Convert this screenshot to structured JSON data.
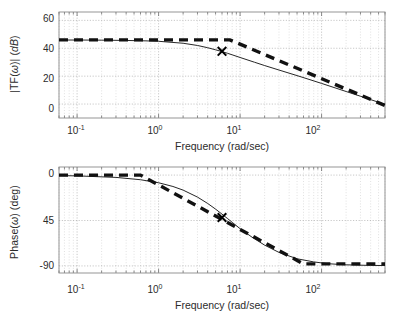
{
  "figure": {
    "kind": "bode-plot",
    "background": "#ffffff",
    "line_color": "#1a1a1a",
    "grid_color": "#9a9a9a"
  },
  "panels": {
    "magnitude": {
      "ylabel_plain": "|TF(ω)| (dB)",
      "ylabel_prefix": "|TF(",
      "ylabel_omega": "ω",
      "ylabel_suffix": ")| (",
      "ylabel_unit": "dB",
      "ylabel_end": ")",
      "xlabel": "Frequency (rad/sec)",
      "yticks": [
        "60",
        "40",
        "20",
        "0"
      ],
      "ytick_values": [
        60,
        40,
        20,
        0
      ],
      "xticks": [
        {
          "mantissa": "10",
          "exp": "-1"
        },
        {
          "mantissa": "10",
          "exp": "0"
        },
        {
          "mantissa": "10",
          "exp": "1"
        },
        {
          "mantissa": "10",
          "exp": "2"
        }
      ]
    },
    "phase": {
      "ylabel_prefix": "Phase(",
      "ylabel_omega": "ω",
      "ylabel_suffix": ") (deg)",
      "ylabel_plain": "Phase(ω) (deg)",
      "xlabel": "Frequency (rad/sec)",
      "yticks": [
        "0",
        "45",
        "-90"
      ],
      "ytick_values": [
        0,
        -45,
        -90
      ],
      "xticks": [
        {
          "mantissa": "10",
          "exp": "-1"
        },
        {
          "mantissa": "10",
          "exp": "0"
        },
        {
          "mantissa": "10",
          "exp": "1"
        },
        {
          "mantissa": "10",
          "exp": "2"
        }
      ]
    }
  },
  "chart_data": [
    {
      "type": "line",
      "id": "magnitude-plot",
      "title": "",
      "xlabel": "Frequency (rad/sec)",
      "ylabel": "|TF(ω)| (dB)",
      "xscale": "log",
      "xlim": [
        0.06,
        600
      ],
      "ylim": [
        -10,
        66
      ],
      "yticks": [
        0,
        20,
        40,
        60
      ],
      "xticks": [
        0.1,
        1,
        10,
        100
      ],
      "grid": true,
      "legend": "none",
      "series": [
        {
          "name": "exact magnitude",
          "style": "solid-thin",
          "x": [
            0.06,
            0.1,
            0.2,
            0.4,
            0.7,
            1,
            2,
            3,
            4,
            5,
            6,
            7,
            8,
            10,
            15,
            20,
            30,
            50,
            70,
            100,
            150,
            200,
            300,
            500,
            600
          ],
          "y": [
            45.9,
            45.9,
            45.8,
            45.6,
            45.3,
            45.0,
            43.6,
            42.0,
            40.4,
            38.9,
            37.6,
            36.4,
            35.3,
            33.4,
            30.0,
            27.6,
            24.4,
            20.4,
            17.7,
            14.8,
            11.4,
            9.0,
            5.6,
            1.3,
            -0.2
          ]
        },
        {
          "name": "asymptotic magnitude",
          "style": "dashed-thick",
          "x": [
            0.06,
            7.5,
            600
          ],
          "y": [
            46.0,
            46.0,
            -1.0
          ]
        }
      ],
      "markers": [
        {
          "label": "x-marker",
          "x": 6.0,
          "y": 37.8,
          "symbol": "x"
        }
      ]
    },
    {
      "type": "line",
      "id": "phase-plot",
      "title": "",
      "xlabel": "Frequency (rad/sec)",
      "ylabel": "Phase(ω) (deg)",
      "xscale": "log",
      "xlim": [
        0.06,
        600
      ],
      "ylim": [
        -97,
        8
      ],
      "yticks": [
        0,
        -45,
        -90
      ],
      "xticks": [
        0.1,
        1,
        10,
        100
      ],
      "grid": true,
      "legend": "none",
      "series": [
        {
          "name": "exact phase",
          "style": "solid-thin",
          "x": [
            0.06,
            0.1,
            0.3,
            0.6,
            1,
            1.5,
            2,
            3,
            4,
            5,
            6,
            7,
            8,
            10,
            14,
            20,
            30,
            50,
            80,
            120,
            200,
            400,
            600
          ],
          "y": [
            -0.5,
            -0.8,
            -2.3,
            -4.6,
            -7.6,
            -11.3,
            -14.9,
            -21.8,
            -28.1,
            -33.7,
            -38.7,
            -43.0,
            -46.8,
            -53.1,
            -61.5,
            -69.4,
            -76.6,
            -82.9,
            -86.0,
            -87.8,
            -88.9,
            -89.5,
            -89.6
          ]
        },
        {
          "name": "asymptotic phase",
          "style": "dashed-thick",
          "x": [
            0.06,
            0.6,
            60,
            600
          ],
          "y": [
            0.0,
            0.0,
            -88.0,
            -88.0
          ]
        }
      ],
      "markers": [
        {
          "label": "x-marker",
          "x": 6.0,
          "y": -42.0,
          "symbol": "x"
        }
      ]
    }
  ]
}
